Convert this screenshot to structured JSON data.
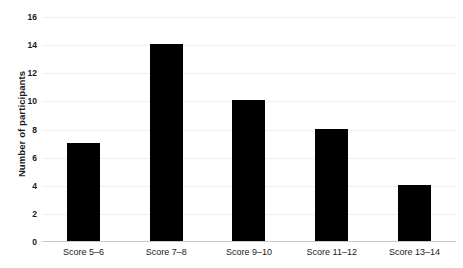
{
  "chart_data": {
    "type": "bar",
    "title": "",
    "subtitle": "",
    "xlabel": "",
    "ylabel": "Number of participants",
    "categories": [
      "Score 5–6",
      "Score 7–8",
      "Score 9–10",
      "Score 11–12",
      "Score 13–14"
    ],
    "values": [
      7,
      14,
      10,
      8,
      4
    ],
    "ylim": [
      0,
      16
    ],
    "ytick_labels": [
      "0",
      "2",
      "4",
      "6",
      "8",
      "10",
      "12",
      "14",
      "16"
    ],
    "ytick_values": [
      0,
      2,
      4,
      6,
      8,
      10,
      12,
      14,
      16
    ],
    "grid": true,
    "legend": null,
    "bar_color": "#000000",
    "gridline_color": "#efefef",
    "axis_color": "#c9c9c9",
    "text_color": "#1a1a1a",
    "background_color": "#ffffff"
  }
}
